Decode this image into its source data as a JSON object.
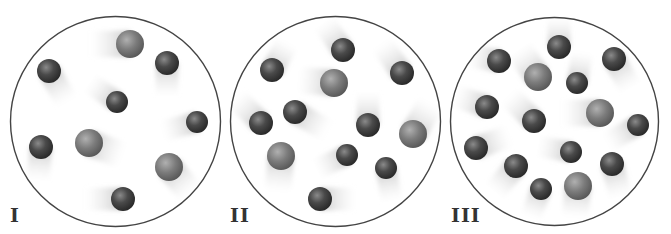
{
  "figure": {
    "colors": {
      "background": "#ffffff",
      "container_outline": "#444444",
      "small_particle": "#3a3a3a",
      "large_particle": "#7a7a7a",
      "trail": "#c8c8c8",
      "label": "#333333"
    },
    "panels": [
      {
        "label": "I",
        "label_pos": [
          10,
          206
        ],
        "circle": {
          "cx": 115.5,
          "cy": 121.5,
          "r": 105
        },
        "particles": [
          {
            "x": 130,
            "y": 44,
            "r": 14,
            "type": "large",
            "trail_angle": 180,
            "trail_len": 40
          },
          {
            "x": 49,
            "y": 71,
            "r": 12,
            "type": "small",
            "trail_angle": 60,
            "trail_len": 36
          },
          {
            "x": 167,
            "y": 63,
            "r": 12,
            "type": "small",
            "trail_angle": 90,
            "trail_len": 34
          },
          {
            "x": 117,
            "y": 102,
            "r": 11,
            "type": "small",
            "trail_angle": 215,
            "trail_len": 34
          },
          {
            "x": 197,
            "y": 122,
            "r": 11,
            "type": "small",
            "trail_angle": 165,
            "trail_len": 36
          },
          {
            "x": 41,
            "y": 147,
            "r": 12,
            "type": "small",
            "trail_angle": 95,
            "trail_len": 34
          },
          {
            "x": 89,
            "y": 143,
            "r": 14,
            "type": "large",
            "trail_angle": 20,
            "trail_len": 36
          },
          {
            "x": 169,
            "y": 167,
            "r": 14,
            "type": "large",
            "trail_angle": 50,
            "trail_len": 34
          },
          {
            "x": 123,
            "y": 199,
            "r": 12,
            "type": "small",
            "trail_angle": 180,
            "trail_len": 38
          }
        ]
      },
      {
        "label": "II",
        "label_pos": [
          230,
          206
        ],
        "circle": {
          "cx": 335.5,
          "cy": 121.5,
          "r": 105
        },
        "particles": [
          {
            "x": 343,
            "y": 50,
            "r": 12,
            "type": "small",
            "trail_angle": 235,
            "trail_len": 34
          },
          {
            "x": 272,
            "y": 70,
            "r": 12,
            "type": "small",
            "trail_angle": 300,
            "trail_len": 32
          },
          {
            "x": 402,
            "y": 73,
            "r": 12,
            "type": "small",
            "trail_angle": 235,
            "trail_len": 36
          },
          {
            "x": 334,
            "y": 83,
            "r": 14,
            "type": "large",
            "trail_angle": 185,
            "trail_len": 36
          },
          {
            "x": 295,
            "y": 112,
            "r": 12,
            "type": "small",
            "trail_angle": 30,
            "trail_len": 38
          },
          {
            "x": 261,
            "y": 123,
            "r": 12,
            "type": "small",
            "trail_angle": 225,
            "trail_len": 36
          },
          {
            "x": 368,
            "y": 125,
            "r": 12,
            "type": "small",
            "trail_angle": 270,
            "trail_len": 34
          },
          {
            "x": 413,
            "y": 134,
            "r": 14,
            "type": "large",
            "trail_angle": 300,
            "trail_len": 36
          },
          {
            "x": 281,
            "y": 156,
            "r": 14,
            "type": "large",
            "trail_angle": 95,
            "trail_len": 36
          },
          {
            "x": 347,
            "y": 155,
            "r": 11,
            "type": "small",
            "trail_angle": 155,
            "trail_len": 34
          },
          {
            "x": 386,
            "y": 168,
            "r": 11,
            "type": "small",
            "trail_angle": 80,
            "trail_len": 34
          },
          {
            "x": 320,
            "y": 199,
            "r": 12,
            "type": "small",
            "trail_angle": 0,
            "trail_len": 36
          }
        ]
      },
      {
        "label": "III",
        "label_pos": [
          451,
          206
        ],
        "circle": {
          "cx": 554.5,
          "cy": 121.5,
          "r": 104
        },
        "particles": [
          {
            "x": 559,
            "y": 47,
            "r": 12,
            "type": "small",
            "trail_angle": 270,
            "trail_len": 30
          },
          {
            "x": 499,
            "y": 61,
            "r": 12,
            "type": "small",
            "trail_angle": 190,
            "trail_len": 30
          },
          {
            "x": 614,
            "y": 59,
            "r": 12,
            "type": "small",
            "trail_angle": 60,
            "trail_len": 34
          },
          {
            "x": 538,
            "y": 77,
            "r": 14,
            "type": "large",
            "trail_angle": 235,
            "trail_len": 34
          },
          {
            "x": 577,
            "y": 83,
            "r": 11,
            "type": "small",
            "trail_angle": 280,
            "trail_len": 32
          },
          {
            "x": 487,
            "y": 107,
            "r": 12,
            "type": "small",
            "trail_angle": 200,
            "trail_len": 34
          },
          {
            "x": 600,
            "y": 113,
            "r": 14,
            "type": "large",
            "trail_angle": 180,
            "trail_len": 38
          },
          {
            "x": 534,
            "y": 121,
            "r": 12,
            "type": "small",
            "trail_angle": 225,
            "trail_len": 36
          },
          {
            "x": 638,
            "y": 125,
            "r": 11,
            "type": "small",
            "trail_angle": 150,
            "trail_len": 36
          },
          {
            "x": 476,
            "y": 148,
            "r": 12,
            "type": "small",
            "trail_angle": 340,
            "trail_len": 36
          },
          {
            "x": 571,
            "y": 152,
            "r": 11,
            "type": "small",
            "trail_angle": 190,
            "trail_len": 34
          },
          {
            "x": 516,
            "y": 166,
            "r": 12,
            "type": "small",
            "trail_angle": 130,
            "trail_len": 34
          },
          {
            "x": 612,
            "y": 164,
            "r": 12,
            "type": "small",
            "trail_angle": 75,
            "trail_len": 34
          },
          {
            "x": 541,
            "y": 189,
            "r": 11,
            "type": "small",
            "trail_angle": 110,
            "trail_len": 30
          },
          {
            "x": 578,
            "y": 186,
            "r": 14,
            "type": "large",
            "trail_angle": 95,
            "trail_len": 32
          }
        ]
      }
    ]
  }
}
